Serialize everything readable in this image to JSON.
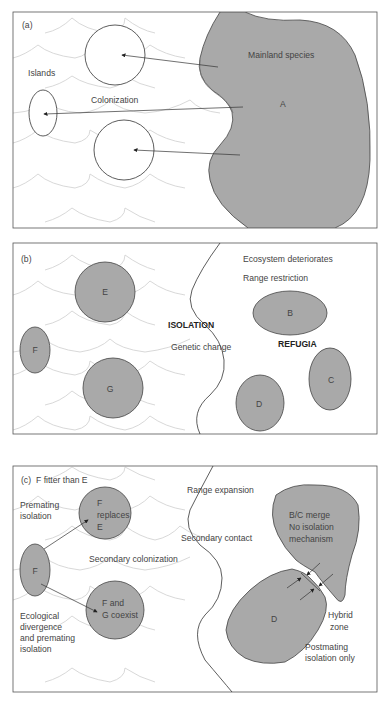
{
  "figure": {
    "panels": [
      {
        "id": "a",
        "tag": "(a)",
        "labels": {
          "islands": "Islands",
          "colonization": "Colonization",
          "mainland": "Mainland species",
          "mainland_letter": "A"
        }
      },
      {
        "id": "b",
        "tag": "(b)",
        "labels": {
          "ecosystem": "Ecosystem deteriorates",
          "range_restriction": "Range restriction",
          "isolation": "ISOLATION",
          "genetic_change": "Genetic change",
          "refugia": "REFUGIA",
          "populations": [
            "E",
            "F",
            "G",
            "B",
            "C",
            "D"
          ]
        }
      },
      {
        "id": "c",
        "tag": "(c)",
        "labels": {
          "fitter": "F fitter than E",
          "premating1": "Premating",
          "premating2": "isolation",
          "replaces1": "F",
          "replaces2": "replaces",
          "replaces3": "E",
          "f_small": "F",
          "secondary_colonization": "Secondary colonization",
          "coexist1": "F and",
          "coexist2": "G coexist",
          "eco1": "Ecological",
          "eco2": "divergence",
          "eco3": "and  premating",
          "eco4": "isolation",
          "range_expansion": "Range expansion",
          "secondary_contact": "Secondary contact",
          "merge1": "B/C merge",
          "merge2": "No isolation",
          "merge3": "mechanism",
          "d_letter": "D",
          "hybrid1": "Hybrid",
          "hybrid2": "zone",
          "post1": "Postmating",
          "post2": "isolation only"
        }
      }
    ]
  }
}
